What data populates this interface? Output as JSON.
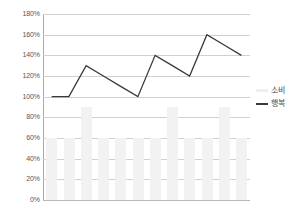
{
  "chart_data": {
    "type": "line",
    "title": "",
    "subtitle": "",
    "xlabel": "",
    "ylabel": "",
    "ylim": [
      0,
      180
    ],
    "ytick_labels": [
      "180%",
      "160%",
      "140%",
      "120%",
      "100%",
      "80%",
      "60%",
      "40%",
      "20%",
      "0%"
    ],
    "ytick_values": [
      180,
      160,
      140,
      120,
      100,
      80,
      60,
      40,
      20,
      0
    ],
    "xtick_labels": [
      "",
      "",
      "",
      "",
      "",
      "",
      "",
      "",
      "",
      "",
      "",
      ""
    ],
    "grid": true,
    "legend_position": "right",
    "categories": [
      "1",
      "2",
      "3",
      "4",
      "5",
      "6",
      "7",
      "8",
      "9",
      "10",
      "11",
      "12"
    ],
    "series": [
      {
        "name": "소비",
        "type": "bar",
        "color": "#f2f2f2",
        "values": [
          60,
          60,
          90,
          60,
          60,
          60,
          60,
          90,
          60,
          60,
          90,
          60
        ]
      },
      {
        "name": "행복",
        "type": "line",
        "color": "#3a3a3a",
        "values": [
          100,
          100,
          130,
          120,
          110,
          100,
          140,
          130,
          120,
          160,
          150,
          140
        ]
      }
    ]
  },
  "legend": {
    "entries": [
      {
        "label": "소비",
        "marker": "bar-swatch"
      },
      {
        "label": "행복",
        "marker": "line-swatch"
      }
    ]
  },
  "colors": {
    "line": "#3a3a3a",
    "bars": "#f2f2f2",
    "grid": "#d0d0d0",
    "axis": "#a8a8a8",
    "text": "#565656",
    "background": "#ffffff"
  }
}
